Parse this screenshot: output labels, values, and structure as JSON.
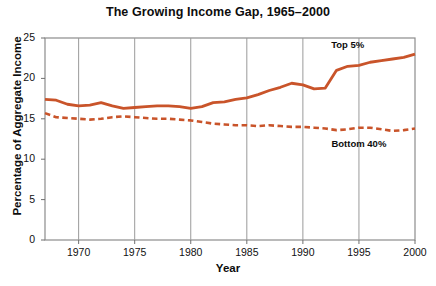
{
  "chart_data": {
    "type": "line",
    "title": "The Growing Income Gap, 1965–2000",
    "xlabel": "Year",
    "ylabel": "Percentage of Aggregate Income",
    "xlim": [
      1967,
      2000
    ],
    "ylim": [
      0,
      25
    ],
    "yticks": [
      0,
      5,
      10,
      15,
      20,
      25
    ],
    "xticks": [
      1970,
      1975,
      1980,
      1985,
      1990,
      1995,
      2000
    ],
    "grid": "vertical",
    "legend_position": "inline-annotations",
    "line_color": "#c9542a",
    "x": [
      1967,
      1968,
      1969,
      1970,
      1971,
      1972,
      1973,
      1974,
      1975,
      1976,
      1977,
      1978,
      1979,
      1980,
      1981,
      1982,
      1983,
      1984,
      1985,
      1986,
      1987,
      1988,
      1989,
      1990,
      1991,
      1992,
      1993,
      1994,
      1995,
      1996,
      1997,
      1998,
      1999,
      2000
    ],
    "series": [
      {
        "name": "Top 5%",
        "style": "solid",
        "values": [
          17.4,
          17.3,
          16.8,
          16.6,
          16.7,
          17.0,
          16.6,
          16.3,
          16.4,
          16.5,
          16.6,
          16.6,
          16.5,
          16.3,
          16.5,
          17.0,
          17.1,
          17.4,
          17.6,
          18.0,
          18.5,
          18.9,
          19.4,
          19.2,
          18.7,
          18.8,
          21.0,
          21.5,
          21.6,
          22.0,
          22.2,
          22.4,
          22.6,
          23.0
        ]
      },
      {
        "name": "Bottom 40%",
        "style": "dashed",
        "values": [
          15.7,
          15.2,
          15.1,
          15.0,
          14.9,
          15.0,
          15.2,
          15.3,
          15.2,
          15.1,
          15.0,
          15.0,
          14.9,
          14.8,
          14.6,
          14.4,
          14.3,
          14.2,
          14.2,
          14.1,
          14.2,
          14.1,
          14.0,
          14.0,
          13.9,
          13.8,
          13.6,
          13.7,
          13.9,
          13.9,
          13.7,
          13.5,
          13.6,
          13.8
        ]
      }
    ],
    "annotations": [
      {
        "text": "Top 5%",
        "x": 1994,
        "y": 24.0
      },
      {
        "text": "Bottom 40%",
        "x": 1995,
        "y": 11.8
      }
    ]
  }
}
